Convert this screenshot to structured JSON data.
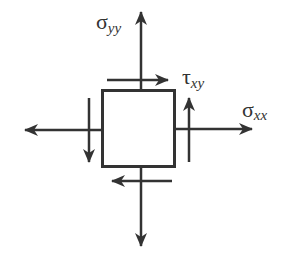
{
  "diagram": {
    "colors": {
      "stroke": "#333333",
      "background": "#ffffff"
    },
    "element": {
      "x": 102,
      "y": 90,
      "width": 73,
      "height": 77
    },
    "labels": {
      "sigma_yy": {
        "symbol": "σ",
        "subscript": "yy"
      },
      "tau_xy": {
        "symbol": "τ",
        "subscript": "xy"
      },
      "sigma_xx": {
        "symbol": "σ",
        "subscript": "xx"
      }
    },
    "arrows": [
      {
        "name": "normal-stress-top",
        "direction": "up"
      },
      {
        "name": "normal-stress-bottom",
        "direction": "down"
      },
      {
        "name": "normal-stress-left",
        "direction": "left"
      },
      {
        "name": "normal-stress-right",
        "direction": "right"
      },
      {
        "name": "shear-stress-top",
        "direction": "right"
      },
      {
        "name": "shear-stress-bottom",
        "direction": "left"
      },
      {
        "name": "shear-stress-left",
        "direction": "down"
      },
      {
        "name": "shear-stress-right",
        "direction": "up"
      }
    ]
  }
}
